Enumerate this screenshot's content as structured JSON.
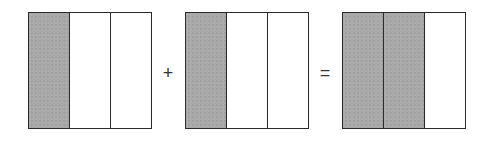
{
  "diagram": {
    "title": "",
    "fractions": [
      {
        "numerator": 1,
        "denominator": 3,
        "parts": [
          "shaded",
          "empty",
          "empty"
        ]
      },
      {
        "numerator": 1,
        "denominator": 3,
        "parts": [
          "shaded",
          "empty",
          "empty"
        ]
      },
      {
        "numerator": 2,
        "denominator": 3,
        "parts": [
          "shaded",
          "shaded",
          "empty"
        ]
      }
    ],
    "operators": [
      "+",
      "="
    ],
    "colors": {
      "shaded": "#a9a9a9",
      "border": "#2a2a2a",
      "empty": "#ffffff"
    }
  }
}
